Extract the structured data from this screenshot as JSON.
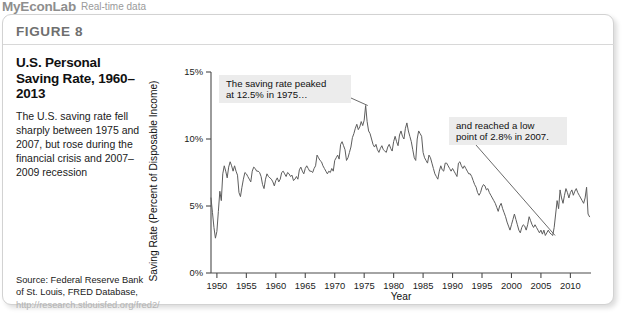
{
  "banner": {
    "brand": "MyEconLab",
    "subtitle": "Real-time data"
  },
  "figure": {
    "number_label": "FIGURE 8",
    "title": "U.S. Personal Saving Rate, 1960–2013",
    "description": "The U.S. saving rate fell sharply between 1975 and 2007, but rose during the financial crisis and 2007–2009 recession",
    "source_prefix": "Source: Federal Reserve Bank of St. Louis, FRED Database, ",
    "source_url": "http://research.stlouisfed.org/fred2/"
  },
  "colors": {
    "line": "#5d5d5d",
    "axis": "#4a4a4a",
    "callout_bg": "#ececec",
    "panel_border": "#d2d2d2",
    "banner_text": "#9a9a9a"
  },
  "chart_data": {
    "type": "line",
    "title": "U.S. Personal Saving Rate, 1960–2013",
    "xlabel": "Year",
    "ylabel": "Saving Rate (Percent of Disposable Income)",
    "xlim": [
      1949,
      2013.5
    ],
    "ylim": [
      0,
      15
    ],
    "grid": false,
    "legend": false,
    "xticks": [
      1950,
      1955,
      1960,
      1965,
      1970,
      1975,
      1980,
      1985,
      1990,
      1995,
      2000,
      2005,
      2010
    ],
    "xtick_labels": [
      "1950",
      "1955",
      "1960",
      "1965",
      "1970",
      "1975",
      "1980",
      "1985",
      "1990",
      "1995",
      "2000",
      "2005",
      "2010"
    ],
    "yticks": [
      0,
      5,
      10,
      15
    ],
    "ytick_labels": [
      "0%",
      "5%",
      "10%",
      "15%"
    ],
    "annotations": [
      {
        "name": "peak-annotation",
        "lines": [
          "The saving rate peaked",
          "at 12.5% in 1975…"
        ],
        "target_x": 1975.6,
        "target_y": 12.5
      },
      {
        "name": "trough-annotation",
        "lines": [
          "and reached a low",
          "point of 2.8% in 2007."
        ],
        "target_x": 2007.4,
        "target_y": 2.8
      }
    ],
    "series": [
      {
        "name": "Personal saving rate",
        "x": [
          1949.0,
          1949.25,
          1949.5,
          1949.75,
          1950.0,
          1950.25,
          1950.5,
          1950.75,
          1951.0,
          1951.25,
          1951.5,
          1951.75,
          1952.0,
          1952.25,
          1952.5,
          1952.75,
          1953.0,
          1953.25,
          1953.5,
          1953.75,
          1954.0,
          1954.25,
          1954.5,
          1954.75,
          1955.0,
          1955.25,
          1955.5,
          1955.75,
          1956.0,
          1956.25,
          1956.5,
          1956.75,
          1957.0,
          1957.25,
          1957.5,
          1957.75,
          1958.0,
          1958.25,
          1958.5,
          1958.75,
          1959.0,
          1959.25,
          1959.5,
          1959.75,
          1960.0,
          1960.25,
          1960.5,
          1960.75,
          1961.0,
          1961.25,
          1961.5,
          1961.75,
          1962.0,
          1962.25,
          1962.5,
          1962.75,
          1963.0,
          1963.25,
          1963.5,
          1963.75,
          1964.0,
          1964.25,
          1964.5,
          1964.75,
          1965.0,
          1965.25,
          1965.5,
          1965.75,
          1966.0,
          1966.25,
          1966.5,
          1966.75,
          1967.0,
          1967.25,
          1967.5,
          1967.75,
          1968.0,
          1968.25,
          1968.5,
          1968.75,
          1969.0,
          1969.25,
          1969.5,
          1969.75,
          1970.0,
          1970.25,
          1970.5,
          1970.75,
          1971.0,
          1971.25,
          1971.5,
          1971.75,
          1972.0,
          1972.25,
          1972.5,
          1972.75,
          1973.0,
          1973.25,
          1973.5,
          1973.75,
          1974.0,
          1974.25,
          1974.5,
          1974.75,
          1975.0,
          1975.25,
          1975.5,
          1975.75,
          1976.0,
          1976.25,
          1976.5,
          1976.75,
          1977.0,
          1977.25,
          1977.5,
          1977.75,
          1978.0,
          1978.25,
          1978.5,
          1978.75,
          1979.0,
          1979.25,
          1979.5,
          1979.75,
          1980.0,
          1980.25,
          1980.5,
          1980.75,
          1981.0,
          1981.25,
          1981.5,
          1981.75,
          1982.0,
          1982.25,
          1982.5,
          1982.75,
          1983.0,
          1983.25,
          1983.5,
          1983.75,
          1984.0,
          1984.25,
          1984.5,
          1984.75,
          1985.0,
          1985.25,
          1985.5,
          1985.75,
          1986.0,
          1986.25,
          1986.5,
          1986.75,
          1987.0,
          1987.25,
          1987.5,
          1987.75,
          1988.0,
          1988.25,
          1988.5,
          1988.75,
          1989.0,
          1989.25,
          1989.5,
          1989.75,
          1990.0,
          1990.25,
          1990.5,
          1990.75,
          1991.0,
          1991.25,
          1991.5,
          1991.75,
          1992.0,
          1992.25,
          1992.5,
          1992.75,
          1993.0,
          1993.25,
          1993.5,
          1993.75,
          1994.0,
          1994.25,
          1994.5,
          1994.75,
          1995.0,
          1995.25,
          1995.5,
          1995.75,
          1996.0,
          1996.25,
          1996.5,
          1996.75,
          1997.0,
          1997.25,
          1997.5,
          1997.75,
          1998.0,
          1998.25,
          1998.5,
          1998.75,
          1999.0,
          1999.25,
          1999.5,
          1999.75,
          2000.0,
          2000.25,
          2000.5,
          2000.75,
          2001.0,
          2001.25,
          2001.5,
          2001.75,
          2002.0,
          2002.25,
          2002.5,
          2002.75,
          2003.0,
          2003.25,
          2003.5,
          2003.75,
          2004.0,
          2004.25,
          2004.5,
          2004.75,
          2005.0,
          2005.25,
          2005.5,
          2005.75,
          2006.0,
          2006.25,
          2006.5,
          2006.75,
          2007.0,
          2007.25,
          2007.5,
          2007.75,
          2008.0,
          2008.25,
          2008.5,
          2008.75,
          2009.0,
          2009.25,
          2009.5,
          2009.75,
          2010.0,
          2010.25,
          2010.5,
          2010.75,
          2011.0,
          2011.25,
          2011.5,
          2011.75,
          2012.0,
          2012.25,
          2012.5,
          2012.75,
          2013.0,
          2013.25
        ],
        "y": [
          5.6,
          4.5,
          3.4,
          2.6,
          3.1,
          4.6,
          6.1,
          5.4,
          7.4,
          8.0,
          7.6,
          7.1,
          7.9,
          8.3,
          8.0,
          7.6,
          8.0,
          7.6,
          7.3,
          6.0,
          5.7,
          6.4,
          7.0,
          7.5,
          7.4,
          7.2,
          7.0,
          6.8,
          7.6,
          7.9,
          7.8,
          7.6,
          7.6,
          7.5,
          7.2,
          6.6,
          6.3,
          7.0,
          7.4,
          7.2,
          7.1,
          7.0,
          6.8,
          6.5,
          6.9,
          7.1,
          6.8,
          7.0,
          7.5,
          7.6,
          7.4,
          7.2,
          7.5,
          7.4,
          7.2,
          7.3,
          6.9,
          7.0,
          7.2,
          7.0,
          7.7,
          7.9,
          7.6,
          7.4,
          7.8,
          8.0,
          7.8,
          7.6,
          7.6,
          7.5,
          7.8,
          8.0,
          8.8,
          8.6,
          8.4,
          8.3,
          8.0,
          7.8,
          7.6,
          7.4,
          7.6,
          7.5,
          7.8,
          7.6,
          8.4,
          8.6,
          8.8,
          8.5,
          9.6,
          9.8,
          9.5,
          9.2,
          8.4,
          8.6,
          9.0,
          9.4,
          10.1,
          10.4,
          10.8,
          11.1,
          10.7,
          10.9,
          11.3,
          11.0,
          11.4,
          12.5,
          11.3,
          10.6,
          10.4,
          10.0,
          9.6,
          9.4,
          9.6,
          9.2,
          9.0,
          9.3,
          9.5,
          9.2,
          9.1,
          9.0,
          9.4,
          9.6,
          9.3,
          9.1,
          9.8,
          10.2,
          9.8,
          9.5,
          10.3,
          10.6,
          10.2,
          10.0,
          10.8,
          11.2,
          10.6,
          10.2,
          9.8,
          9.2,
          8.6,
          8.4,
          10.0,
          10.6,
          10.4,
          10.2,
          9.0,
          8.6,
          8.4,
          8.2,
          8.8,
          8.6,
          8.2,
          7.8,
          7.4,
          7.2,
          7.0,
          7.6,
          8.0,
          7.7,
          7.6,
          8.2,
          8.2,
          8.0,
          7.8,
          7.6,
          7.8,
          7.6,
          7.4,
          7.2,
          8.2,
          8.3,
          8.0,
          7.8,
          8.0,
          7.8,
          7.6,
          7.4,
          7.4,
          7.2,
          6.9,
          6.6,
          6.4,
          6.0,
          5.8,
          6.0,
          6.4,
          6.6,
          6.5,
          6.2,
          6.3,
          6.0,
          5.8,
          5.6,
          5.4,
          5.2,
          4.9,
          4.6,
          5.0,
          5.2,
          4.8,
          4.5,
          4.2,
          3.8,
          3.5,
          3.2,
          3.6,
          4.0,
          4.4,
          4.0,
          3.6,
          3.2,
          3.0,
          3.4,
          3.6,
          3.5,
          3.2,
          3.6,
          4.2,
          3.9,
          3.6,
          3.4,
          3.6,
          3.4,
          3.2,
          3.0,
          3.2,
          2.9,
          3.2,
          2.8,
          3.0,
          3.2,
          3.0,
          2.9,
          2.8,
          3.4,
          4.4,
          5.4,
          4.8,
          6.2,
          5.6,
          5.2,
          5.8,
          6.3,
          6.0,
          5.6,
          6.0,
          6.2,
          5.8,
          6.1,
          6.3,
          6.0,
          5.8,
          5.6,
          5.4,
          5.2,
          5.6,
          6.4,
          4.4,
          4.2
        ]
      }
    ]
  }
}
